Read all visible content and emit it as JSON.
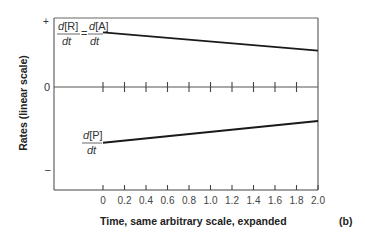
{
  "chart_data": {
    "type": "line",
    "title": "",
    "panel_label": "(b)",
    "xlabel": "Time, same arbitrary scale, expanded",
    "ylabel": "Rates (linear scale)",
    "x_ticks": [
      "0",
      "0.2",
      "0.4",
      "0.6",
      "0.8",
      "1.0",
      "1.2",
      "1.4",
      "1.6",
      "1.8",
      "2.0"
    ],
    "xlim": [
      0,
      2.0
    ],
    "y_tick_labels": {
      "plus": "+",
      "zero": "0",
      "minus": "–"
    },
    "grid": false,
    "series": [
      {
        "name": "d[R]/dt = d[A]/dt",
        "label_parts": {
          "num1": "d[R]",
          "den1": "dt",
          "eq": "=",
          "num2": "d[A]",
          "den2": "dt"
        },
        "x": [
          0,
          2.0
        ],
        "y": [
          0.78,
          0.52
        ],
        "trend": "decreasing, positive"
      },
      {
        "name": "d[P]/dt",
        "label_parts": {
          "num1": "d[P]",
          "den1": "dt"
        },
        "x": [
          0,
          2.0
        ],
        "y": [
          -0.82,
          -0.5
        ],
        "trend": "increasing, negative"
      }
    ]
  },
  "colors": {
    "line": "#1a1a1a",
    "axis": "#555555",
    "text": "#333333",
    "background": "#ffffff"
  }
}
